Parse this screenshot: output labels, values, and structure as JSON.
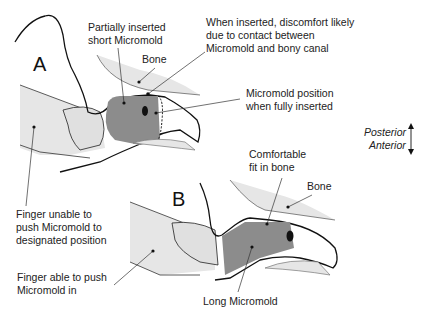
{
  "panels": {
    "a": "A",
    "b": "B"
  },
  "labels": {
    "partially_inserted": [
      "Partially inserted",
      "short Micromold"
    ],
    "discomfort": [
      "When inserted, discomfort likely",
      "due  to contact between",
      "Micromold and bony canal"
    ],
    "bone_a": "Bone",
    "fully_inserted": [
      "Micromold position",
      "when fully inserted"
    ],
    "finger_unable": [
      "Finger unable to",
      "push Micromold to",
      "designated position"
    ],
    "comfortable": [
      "Comfortable",
      "fit in bone"
    ],
    "bone_b": "Bone",
    "finger_able": [
      "Finger able to push",
      "Micromold in"
    ],
    "long_micromold": "Long Micromold"
  },
  "orientation": {
    "posterior": "Posterior",
    "anterior": "Anterior"
  },
  "colors": {
    "skin": "#e6e6e6",
    "micromold": "#8c8c8c",
    "outline": "#111111"
  }
}
